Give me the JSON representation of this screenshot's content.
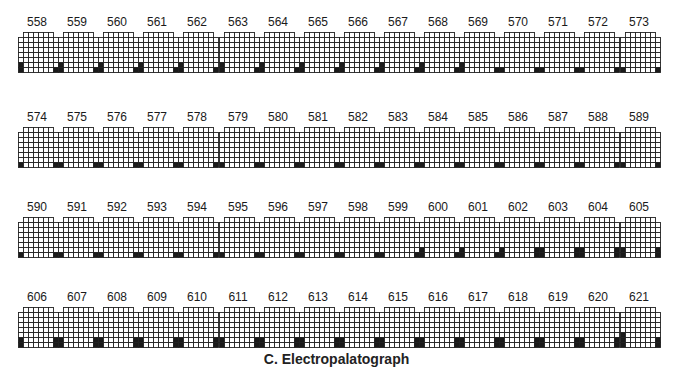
{
  "figure": {
    "caption": "C. Electropalatograph",
    "grid": {
      "rows": 8,
      "top_row_cells": 6,
      "other_row_cells": 8,
      "cell_size": 5,
      "colors": {
        "contact": "#1a1a1a",
        "no_contact": "#ffffff",
        "line": "#222222"
      }
    },
    "rows": [
      {
        "label_y": 15,
        "grid_y": 32,
        "frames": [
          {
            "label": "558",
            "left": 2,
            "right": 1
          },
          {
            "label": "559",
            "left": 2,
            "right": 1
          },
          {
            "label": "560",
            "left": 2,
            "right": 1
          },
          {
            "label": "561",
            "left": 2,
            "right": 1
          },
          {
            "label": "562",
            "left": 2,
            "right": 1
          },
          {
            "label": "563",
            "left": 2,
            "right": 1
          },
          {
            "label": "564",
            "left": 2,
            "right": 1
          },
          {
            "label": "565",
            "left": 2,
            "right": 1
          },
          {
            "label": "566",
            "left": 2,
            "right": 1
          },
          {
            "label": "567",
            "left": 2,
            "right": 1
          },
          {
            "label": "568",
            "left": 2,
            "right": 1
          },
          {
            "label": "569",
            "left": 2,
            "right": 1
          },
          {
            "label": "570",
            "left": 1,
            "right": 1
          },
          {
            "label": "571",
            "left": 1,
            "right": 1
          },
          {
            "label": "572",
            "left": 1,
            "right": 1
          },
          {
            "label": "573",
            "left": 1,
            "right": 1
          }
        ]
      },
      {
        "label_y": 110,
        "grid_y": 127,
        "frames": [
          {
            "label": "574",
            "left": 1,
            "right": 1
          },
          {
            "label": "575",
            "left": 1,
            "right": 1
          },
          {
            "label": "576",
            "left": 1,
            "right": 1
          },
          {
            "label": "577",
            "left": 1,
            "right": 1
          },
          {
            "label": "578",
            "left": 1,
            "right": 1
          },
          {
            "label": "579",
            "left": 1,
            "right": 1
          },
          {
            "label": "580",
            "left": 1,
            "right": 1
          },
          {
            "label": "581",
            "left": 1,
            "right": 1
          },
          {
            "label": "582",
            "left": 1,
            "right": 1
          },
          {
            "label": "583",
            "left": 1,
            "right": 1
          },
          {
            "label": "584",
            "left": 1,
            "right": 1
          },
          {
            "label": "585",
            "left": 1,
            "right": 1
          },
          {
            "label": "586",
            "left": 1,
            "right": 1
          },
          {
            "label": "587",
            "left": 1,
            "right": 1
          },
          {
            "label": "588",
            "left": 1,
            "right": 1
          },
          {
            "label": "589",
            "left": 1,
            "right": 1
          }
        ]
      },
      {
        "label_y": 200,
        "grid_y": 217,
        "frames": [
          {
            "label": "590",
            "left": 1,
            "right": 1
          },
          {
            "label": "591",
            "left": 1,
            "right": 1
          },
          {
            "label": "592",
            "left": 1,
            "right": 1
          },
          {
            "label": "593",
            "left": 1,
            "right": 1
          },
          {
            "label": "594",
            "left": 1,
            "right": 1
          },
          {
            "label": "595",
            "left": 1,
            "right": 1
          },
          {
            "label": "596",
            "left": 1,
            "right": 1
          },
          {
            "label": "597",
            "left": 1,
            "right": 1
          },
          {
            "label": "598",
            "left": 1,
            "right": 1
          },
          {
            "label": "599",
            "left": 1,
            "right": 1
          },
          {
            "label": "600",
            "left": 2,
            "right": 1
          },
          {
            "label": "601",
            "left": 2,
            "right": 1
          },
          {
            "label": "602",
            "left": 2,
            "right": 2
          },
          {
            "label": "603",
            "left": 2,
            "right": 2
          },
          {
            "label": "604",
            "left": 2,
            "right": 2
          },
          {
            "label": "605",
            "left": 2,
            "right": 2
          }
        ]
      },
      {
        "label_y": 290,
        "grid_y": 307,
        "frames": [
          {
            "label": "606",
            "left": 2,
            "right": 2
          },
          {
            "label": "607",
            "left": 2,
            "right": 2
          },
          {
            "label": "608",
            "left": 2,
            "right": 2
          },
          {
            "label": "609",
            "left": 2,
            "right": 2
          },
          {
            "label": "610",
            "left": 2,
            "right": 2
          },
          {
            "label": "611",
            "left": 2,
            "right": 2
          },
          {
            "label": "612",
            "left": 2,
            "right": 2
          },
          {
            "label": "613",
            "left": 2,
            "right": 2
          },
          {
            "label": "614",
            "left": 2,
            "right": 2
          },
          {
            "label": "615",
            "left": 2,
            "right": 2
          },
          {
            "label": "616",
            "left": 2,
            "right": 2
          },
          {
            "label": "617",
            "left": 2,
            "right": 2
          },
          {
            "label": "618",
            "left": 2,
            "right": 2
          },
          {
            "label": "619",
            "left": 2,
            "right": 2
          },
          {
            "label": "620",
            "left": 2,
            "right": 2
          },
          {
            "label": "621",
            "left": 3,
            "right": 2
          }
        ]
      }
    ],
    "layout": {
      "x0": 18,
      "pitch": 40.1
    }
  }
}
